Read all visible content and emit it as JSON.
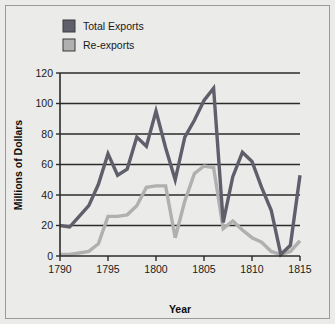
{
  "figure": {
    "background_color": "#ebebe9",
    "border_color": "#9a9a9a"
  },
  "legend": {
    "position": "top-left-inside",
    "items": [
      {
        "label": "Total Exports",
        "color": "#5f5f6b",
        "swatch_name": "legend-swatch-total-exports"
      },
      {
        "label": "Re-exports",
        "color": "#b0b0b0",
        "swatch_name": "legend-swatch-re-exports"
      }
    ]
  },
  "axes": {
    "x_title": "Year",
    "y_title": "Millions of Dollars",
    "x_ticks": [
      "1790",
      "1795",
      "1800",
      "1805",
      "1810",
      "1815"
    ],
    "y_ticks": [
      "0",
      "20",
      "40",
      "60",
      "80",
      "100",
      "120"
    ]
  },
  "chart_data": {
    "type": "line",
    "title": "",
    "subtitle": "",
    "xlabel": "Year",
    "ylabel": "Millions of Dollars",
    "xlim": [
      1790,
      1815
    ],
    "ylim": [
      0,
      120
    ],
    "grid": true,
    "grid_axis": "y",
    "legend_position": "top-left",
    "x": [
      1790,
      1791,
      1792,
      1793,
      1794,
      1795,
      1796,
      1797,
      1798,
      1799,
      1800,
      1801,
      1802,
      1803,
      1804,
      1805,
      1806,
      1807,
      1808,
      1809,
      1810,
      1811,
      1812,
      1813,
      1814,
      1815
    ],
    "series": [
      {
        "name": "Total Exports",
        "color": "#5f5f6b",
        "values": [
          20,
          19,
          26,
          33,
          47,
          67,
          53,
          57,
          78,
          72,
          95,
          71,
          50,
          78,
          89,
          102,
          110,
          22,
          52,
          68,
          62,
          45,
          30,
          1,
          7,
          53
        ]
      },
      {
        "name": "Re-exports",
        "color": "#b0b0b0",
        "values": [
          1,
          1,
          2,
          3,
          8,
          26,
          26,
          27,
          33,
          45,
          46,
          46,
          12,
          36,
          54,
          59,
          58,
          18,
          23,
          17,
          12,
          9,
          3,
          1,
          3,
          10
        ]
      }
    ]
  }
}
